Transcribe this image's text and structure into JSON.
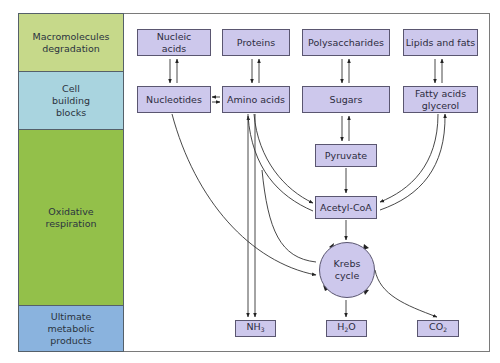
{
  "diagram": {
    "title": "",
    "colors": {
      "row_macromolecules": "#c6d98a",
      "row_building_blocks": "#a9d4df",
      "row_oxidative": "#93c04a",
      "row_products": "#8ab3de",
      "node_fill": "#cdc8ec",
      "node_border": "#5a5670",
      "frame_border": "#7a7a7a"
    },
    "rows": [
      {
        "id": "macromolecules",
        "label": "Macromolecules degradation"
      },
      {
        "id": "building_blocks",
        "label": "Cell building blocks"
      },
      {
        "id": "oxidative",
        "label": "Oxidative respiration"
      },
      {
        "id": "products",
        "label": "Ultimate metabolic products"
      }
    ],
    "nodes": {
      "nucleic_acids": "Nucleic acids",
      "proteins": "Proteins",
      "polysaccharides": "Polysaccharides",
      "lipids": "Lipids and fats",
      "nucleotides": "Nucleotides",
      "amino_acids": "Amino acids",
      "sugars": "Sugars",
      "fatty_acids": "Fatty acids glycerol",
      "pyruvate": "Pyruvate",
      "acetyl_coa": "Acetyl-CoA",
      "krebs": "Krebs cycle",
      "nh3": {
        "base": "NH",
        "sub": "3"
      },
      "h2o": {
        "base": "H",
        "sub": "2",
        "tail": "O"
      },
      "co2": {
        "base": "CO",
        "sub": "2"
      }
    },
    "edges": [
      {
        "from": "Nucleic acids",
        "to": "Nucleotides",
        "type": "reversible"
      },
      {
        "from": "Proteins",
        "to": "Amino acids",
        "type": "reversible"
      },
      {
        "from": "Polysaccharides",
        "to": "Sugars",
        "type": "reversible"
      },
      {
        "from": "Lipids and fats",
        "to": "Fatty acids glycerol",
        "type": "reversible"
      },
      {
        "from": "Nucleotides",
        "to": "Amino acids",
        "type": "reversible"
      },
      {
        "from": "Sugars",
        "to": "Pyruvate",
        "type": "reversible"
      },
      {
        "from": "Pyruvate",
        "to": "Acetyl-CoA",
        "type": "forward"
      },
      {
        "from": "Amino acids",
        "to": "Acetyl-CoA",
        "type": "reversible"
      },
      {
        "from": "Fatty acids glycerol",
        "to": "Acetyl-CoA",
        "type": "reversible"
      },
      {
        "from": "Acetyl-CoA",
        "to": "Krebs cycle",
        "type": "forward"
      },
      {
        "from": "Nucleotides",
        "to": "Krebs cycle",
        "type": "forward"
      },
      {
        "from": "Amino acids",
        "to": "Krebs cycle",
        "type": "reversible"
      },
      {
        "from": "Amino acids",
        "to": "NH3",
        "type": "forward"
      },
      {
        "from": "Nucleotides",
        "to": "NH3",
        "type": "forward"
      },
      {
        "from": "Krebs cycle",
        "to": "H2O",
        "type": "forward"
      },
      {
        "from": "Krebs cycle",
        "to": "CO2",
        "type": "forward"
      }
    ]
  }
}
